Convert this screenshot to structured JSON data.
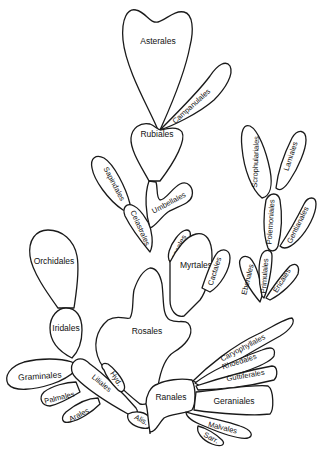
{
  "diagram": {
    "type": "phylogenetic-bush",
    "colors": {
      "outline": "#1a1a1a",
      "fill": "#ffffff",
      "text": "#111111"
    },
    "orders": {
      "asterales": "Asterales",
      "campanulales": "Campanulales",
      "rubiales": "Rubiales",
      "sapindales": "Sapindales",
      "umbellales": "Umbellales",
      "celastrales": "Celastrales",
      "scrophulariales": "Scrophulariales",
      "lamiales": "Lamiales",
      "polemoniales": "Polemoniales",
      "gentianales": "Gentianales",
      "ebenales": "Ebenales",
      "primulales": "Primulales",
      "ericales": "Ericales",
      "loasales": "Loasales",
      "myrtales": "Myrtales",
      "cactales": "Cactales",
      "orchidales": "Orchidales",
      "iridales": "Iridales",
      "rosales": "Rosales",
      "caryophyllales": "Caryophyllales",
      "rhoedales": "Rhoedales",
      "guttiferales": "Guttiferales",
      "graminales": "Graminales",
      "palmales": "Palmales",
      "liliales": "Liliales",
      "hyd": "Hyd.",
      "arales": "Arales",
      "alis": "Alis.",
      "ranales": "Ranales",
      "geraniales": "Geraniales",
      "malvales": "Malvales",
      "sarr": "Sarr."
    }
  }
}
